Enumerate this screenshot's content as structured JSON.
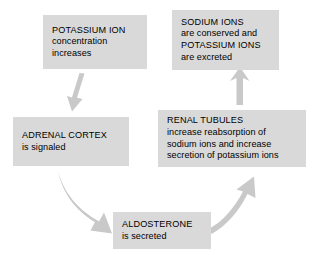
{
  "diagram": {
    "background_color": "#ffffff",
    "box_fill_color": "#d9d9d9",
    "arrow_color": "#c9c9c9",
    "text_color": "#000000",
    "nodes": [
      {
        "id": "potassium",
        "heading": "POTASSIUM ION",
        "lines": [
          "concentration",
          "increases"
        ]
      },
      {
        "id": "sodium",
        "heading": "SODIUM IONS",
        "lines": [
          "are conserved and",
          "POTASSIUM IONS",
          "are excreted"
        ]
      },
      {
        "id": "adrenal",
        "heading": "ADRENAL CORTEX",
        "lines": [
          "is signaled"
        ]
      },
      {
        "id": "renal",
        "heading": "RENAL TUBULES",
        "lines": [
          "increase reabsorption of",
          "sodium ions and increase",
          "secretion of potassium ions"
        ]
      },
      {
        "id": "aldosterone",
        "heading": "ALDOSTERONE",
        "lines": [
          "is secreted"
        ]
      }
    ],
    "arrows": [
      {
        "id": "potassium-to-adrenal",
        "from": "potassium",
        "to": "adrenal",
        "direction": "down-left"
      },
      {
        "id": "adrenal-to-aldosterone",
        "from": "adrenal",
        "to": "aldosterone",
        "direction": "down-right"
      },
      {
        "id": "aldosterone-to-renal",
        "from": "aldosterone",
        "to": "renal",
        "direction": "up-right"
      },
      {
        "id": "renal-to-sodium",
        "from": "renal",
        "to": "sodium",
        "direction": "up"
      }
    ]
  }
}
